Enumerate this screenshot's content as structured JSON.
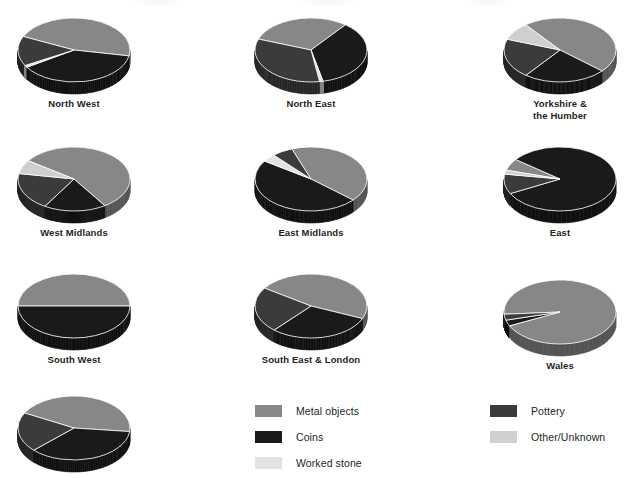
{
  "figure": {
    "title": "",
    "background": "#ffffff"
  },
  "palette": {
    "metal_objects": "#878787",
    "coins": "#1a1a1a",
    "worked_stone": "#e3e3e3",
    "pottery": "#3b3b3b",
    "other_unknown": "#cfcfcf",
    "edge": "#ffffff"
  },
  "legend": {
    "columns": [
      {
        "items": [
          {
            "label": "Metal objects",
            "color": "#878787",
            "swatch": "legend-swatch-metal-objects"
          },
          {
            "label": "Coins",
            "color": "#1a1a1a",
            "swatch": "legend-swatch-coins"
          },
          {
            "label": "Worked stone",
            "color": "#e3e3e3",
            "swatch": "legend-swatch-worked-stone"
          }
        ]
      },
      {
        "items": [
          {
            "label": "Pottery",
            "color": "#3b3b3b",
            "swatch": "legend-swatch-pottery"
          },
          {
            "label": "Other/Unknown",
            "color": "#cfcfcf",
            "swatch": "legend-swatch-other-unknown"
          }
        ]
      }
    ]
  },
  "chart_data": {
    "type": "pie",
    "title": "",
    "xlabel": "",
    "ylabel": "",
    "legend_position": "bottom",
    "grid": false,
    "categories": [
      "Metal objects",
      "Coins",
      "Worked stone",
      "Pottery",
      "Other/Unknown"
    ],
    "colors": [
      "#878787",
      "#1a1a1a",
      "#e3e3e3",
      "#3b3b3b",
      "#cfcfcf"
    ],
    "note": "Small multiples: one 3-D pie per region. Values are percentages estimated from slice angles.",
    "charts": [
      {
        "name": "North West",
        "label": "North West",
        "values": [
          46,
          38,
          1,
          15,
          0
        ]
      },
      {
        "name": "North East",
        "label": "North East",
        "values": [
          30,
          36,
          1,
          33,
          0
        ]
      },
      {
        "name": "Yorkshire & the Humber",
        "label": "Yorkshire &\nthe Humber",
        "values": [
          47,
          24,
          0,
          20,
          9
        ]
      },
      {
        "name": "West Midlands",
        "label": "West Midlands",
        "values": [
          56,
          18,
          0,
          19,
          7
        ]
      },
      {
        "name": "East Midlands",
        "label": "East Midlands",
        "values": [
          42,
          48,
          4,
          6,
          0
        ]
      },
      {
        "name": "East",
        "label": "East",
        "values": [
          6,
          82,
          0,
          10,
          2
        ]
      },
      {
        "name": "South West",
        "label": "South West",
        "values": [
          50,
          50,
          0,
          0,
          0
        ]
      },
      {
        "name": "South East & London",
        "label": "South East & London",
        "values": [
          47,
          30,
          0,
          23,
          0
        ]
      },
      {
        "name": "Wales",
        "label": "Wales",
        "values": [
          94,
          3,
          0,
          3,
          0
        ]
      },
      {
        "name": "Unlabelled",
        "label": "",
        "values": [
          44,
          36,
          0,
          20,
          0
        ]
      }
    ]
  },
  "layout": {
    "positions": [
      {
        "left": 14,
        "top": 12
      },
      {
        "left": 251,
        "top": 12
      },
      {
        "left": 500,
        "top": 12
      },
      {
        "left": 14,
        "top": 141
      },
      {
        "left": 251,
        "top": 141
      },
      {
        "left": 500,
        "top": 141
      },
      {
        "left": 14,
        "top": 268
      },
      {
        "left": 251,
        "top": 268
      },
      {
        "left": 500,
        "top": 274
      },
      {
        "left": 14,
        "top": 390
      }
    ],
    "rotations": [
      205,
      200,
      232,
      215,
      250,
      196,
      180,
      214,
      176,
      208
    ]
  }
}
